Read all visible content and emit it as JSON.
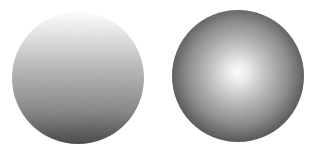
{
  "shapes": [
    {
      "id": "linear-sphere",
      "type": "circle",
      "fill": "linear-gradient",
      "direction": "top-to-bottom",
      "stops": [
        "#ffffff",
        "#d6d6d6",
        "#a8a8a8",
        "#7a7a7a",
        "#3e3e3e"
      ],
      "cx": 78,
      "cy": 78,
      "r": 66
    },
    {
      "id": "radial-sphere",
      "type": "circle",
      "fill": "radial-gradient",
      "center": "middle",
      "stops": [
        "#ffffff",
        "#c2c2c2",
        "#8c8c8c",
        "#5e5e5e",
        "#404040"
      ],
      "cx": 238,
      "cy": 76,
      "r": 66
    }
  ],
  "colors": {
    "background": "#ffffff",
    "highlight": "#ffffff",
    "shadow": "#3e3e3e"
  }
}
